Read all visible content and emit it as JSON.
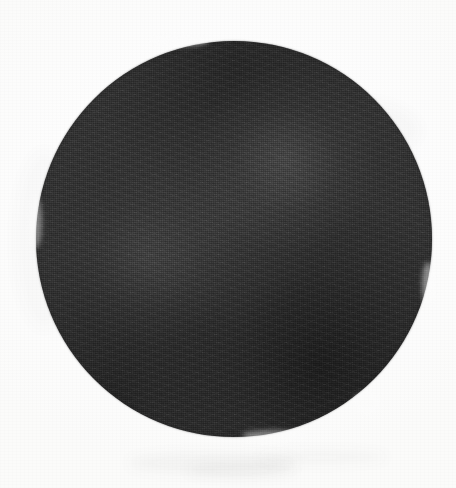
{
  "artwork": {
    "medium_label": "Charcoal on paper",
    "subject_label": "Solid dark circle",
    "caption": "A hand-drawn solid dark charcoal circle filling most of a white paper sheet",
    "canvas": {
      "width_px": 456,
      "height_px": 488,
      "background_color": "#ffffff",
      "paper_tone_color": "#fdfdfd"
    },
    "shape": {
      "name": "circle",
      "center_x_px": 234,
      "center_y_px": 239,
      "radius_px": 198,
      "diameter_px": 396,
      "top_edge_y_px": 41,
      "bottom_edge_y_px": 437,
      "left_edge_x_px": 36,
      "right_edge_x_px": 432,
      "fill_color": "#323232",
      "darkest_tone_color": "#1e1e1e",
      "lightest_tone_color": "#4a4a4a",
      "edge_quality": "soft hand-drawn contour"
    },
    "tonal_notes": [
      {
        "region": "upper-center-right highlight",
        "tone": "#454545"
      },
      {
        "region": "left-of-center highlight",
        "tone": "#3f3f3f"
      },
      {
        "region": "lower-right shadow",
        "tone": "#242424"
      },
      {
        "region": "upper rim",
        "tone": "#282828"
      }
    ],
    "margin_marks": {
      "label": "faint charcoal dust smudges in lower margin",
      "tone": "#f4f4f4"
    }
  }
}
